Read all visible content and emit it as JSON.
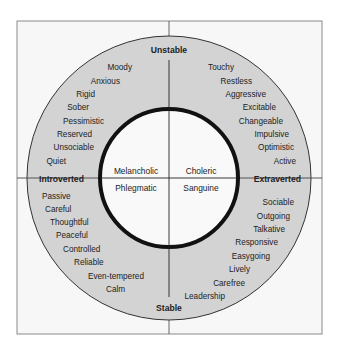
{
  "diagram": {
    "colors": {
      "background": "#ffffff",
      "frame_fill": "#f7f7f7",
      "frame_stroke": "#8a8a8a",
      "ring_fill": "#d3d3d3",
      "inner_fill": "#f9f9f9",
      "inner_stroke": "#111111",
      "text": "#222222"
    },
    "axes": {
      "top": "Unstable",
      "bottom": "Stable",
      "left": "Introverted",
      "right": "Extraverted"
    },
    "temperaments": {
      "top_left": "Melancholic",
      "top_right": "Choleric",
      "bottom_left": "Phlegmatic",
      "bottom_right": "Sanguine"
    },
    "quadrants": {
      "unstable_introverted": [
        "Moody",
        "Anxious",
        "Rigid",
        "Sober",
        "Pessimistic",
        "Reserved",
        "Unsociable",
        "Quiet"
      ],
      "unstable_extraverted": [
        "Touchy",
        "Restless",
        "Aggressive",
        "Excitable",
        "Changeable",
        "Impulsive",
        "Optimistic",
        "Active"
      ],
      "stable_introverted": [
        "Passive",
        "Careful",
        "Thoughtful",
        "Peaceful",
        "Controlled",
        "Reliable",
        "Even-tempered",
        "Calm"
      ],
      "stable_extraverted": [
        "Sociable",
        "Outgoing",
        "Talkative",
        "Responsive",
        "Easygoing",
        "Lively",
        "Carefree",
        "Leadership"
      ]
    }
  }
}
